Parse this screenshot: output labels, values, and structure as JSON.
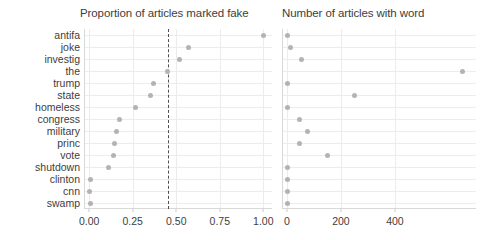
{
  "chart_data": {
    "type": "scatter",
    "title": "",
    "layout": "two horizontal dot-plot panels sharing a categorical y axis",
    "categories": [
      "antifa",
      "joke",
      "investig",
      "the",
      "trump",
      "state",
      "homeless",
      "congress",
      "military",
      "princ",
      "vote",
      "shutdown",
      "clinton",
      "cnn",
      "swamp"
    ],
    "ylabel": "",
    "grid": true,
    "legend": "none",
    "panels": [
      {
        "title": "Proportion of articles marked fake",
        "xlabel": "",
        "xlim": [
          -0.03,
          1.05
        ],
        "xticks": [
          0.0,
          0.25,
          0.5,
          0.75,
          1.0
        ],
        "xtick_labels": [
          "0.00",
          "0.25",
          "0.50",
          "0.75",
          "1.00"
        ],
        "values": [
          1.0,
          0.57,
          0.52,
          0.45,
          0.37,
          0.35,
          0.265,
          0.175,
          0.155,
          0.145,
          0.14,
          0.11,
          0.005,
          0.003,
          0.005
        ],
        "reference_line": {
          "value": 0.45,
          "style": "dashed",
          "color": "#4f4f4f"
        }
      },
      {
        "title": "Number of articles with word",
        "xlabel": "",
        "xlim": [
          -18,
          700
        ],
        "xticks": [
          0,
          200,
          400
        ],
        "xtick_labels": [
          "0",
          "200",
          "400"
        ],
        "values": [
          3,
          12,
          55,
          650,
          3,
          250,
          4,
          48,
          78,
          45,
          152,
          3,
          2,
          2,
          2
        ],
        "reference_line": null
      }
    ]
  },
  "colors": {
    "dot": "#b3b3b3",
    "grid": "#ececec",
    "axis": "#d8d8d8",
    "text": "#3d3d3d",
    "refline": "#4f4f4f",
    "background": "#ffffff"
  }
}
